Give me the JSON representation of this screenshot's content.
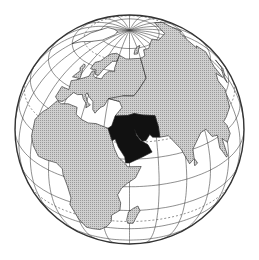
{
  "map": {
    "type": "orthographic-globe",
    "center": {
      "lat": 30,
      "lon": 45
    },
    "highlighted_region": "Middle East",
    "graticule_step_degrees": 15,
    "dashed_parallels": [
      "Tropic of Cancer",
      "Tropic of Capricorn",
      "Arctic Circle"
    ],
    "colors": {
      "highlight": "#111111",
      "land": "#cfcfcf",
      "land_hatch": "#9a9a9a",
      "ocean": "#ffffff",
      "lines": "#333333"
    },
    "regions": [
      {
        "name": "Middle East",
        "style": "highlight"
      },
      {
        "name": "Europe",
        "style": "land"
      },
      {
        "name": "Africa",
        "style": "land"
      },
      {
        "name": "Asia",
        "style": "land"
      },
      {
        "name": "Madagascar",
        "style": "land"
      },
      {
        "name": "Arctic ice",
        "style": "ice"
      }
    ]
  }
}
